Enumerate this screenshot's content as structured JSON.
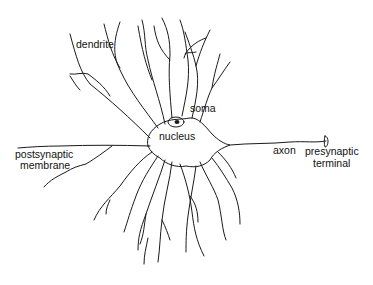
{
  "diagram": {
    "labels": {
      "dendrite": "dendrite",
      "soma": "soma",
      "nucleus": "nucleus",
      "axon": "axon",
      "presynaptic_line1": "presynaptic",
      "presynaptic_line2": "terminal",
      "postsynaptic_line1": "postsynaptic",
      "postsynaptic_line2": "membrane"
    },
    "colors": {
      "ink": "#1a1a1a",
      "background": "#ffffff"
    }
  }
}
